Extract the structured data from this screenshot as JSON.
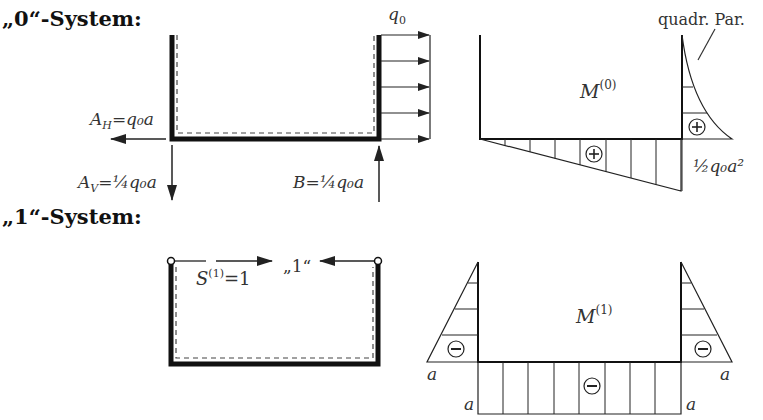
{
  "headings": {
    "system0": "„0“-System:",
    "system1": "„1“-System:"
  },
  "system0": {
    "load_label": "q",
    "load_sub": "0",
    "AH_label": "A",
    "AH_sub": "H",
    "AH_value": "=q₀a",
    "AV_label": "A",
    "AV_sub": "V",
    "AV_value": "=¼q₀a",
    "B_label": "B=¼q₀a"
  },
  "moment0": {
    "title": "M",
    "title_sup": "(0)",
    "annotation": "quadr. Par.",
    "value_label": "½q₀a²",
    "sign_bottom": "+",
    "sign_right": "+"
  },
  "system1": {
    "force_label": "S",
    "force_sup": "(1)",
    "force_value": "=1",
    "unit_label": "„1“"
  },
  "moment1": {
    "title": "M",
    "title_sup": "(1)",
    "left_label": "a",
    "right_label": "a",
    "bottom_left_label": "a",
    "bottom_right_label": "a",
    "sign_left": "−",
    "sign_right": "−",
    "sign_bottom": "−"
  }
}
